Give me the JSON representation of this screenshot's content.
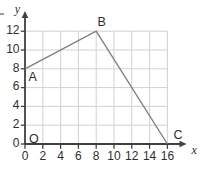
{
  "chart_data": {
    "type": "line",
    "title": "",
    "xlabel": "x",
    "ylabel": "y",
    "origin_label": "O",
    "xlim": [
      0,
      16
    ],
    "ylim": [
      0,
      12
    ],
    "x_ticks": [
      "0",
      "2",
      "4",
      "6",
      "8",
      "10",
      "12",
      "14",
      "16"
    ],
    "y_ticks": [
      "0",
      "2",
      "4",
      "6",
      "8",
      "10",
      "12"
    ],
    "grid": true,
    "grid_step": 2,
    "series": [
      {
        "name": "segment path A-B-C",
        "points": [
          {
            "label": "A",
            "x": 0,
            "y": 8
          },
          {
            "label": "B",
            "x": 8,
            "y": 12
          },
          {
            "label": "C",
            "x": 16,
            "y": 0
          }
        ]
      }
    ],
    "colors": {
      "grid": "#cfd2d3",
      "axis": "#404040",
      "segment": "#7f7f7f",
      "text": "#2e2e2e"
    }
  }
}
